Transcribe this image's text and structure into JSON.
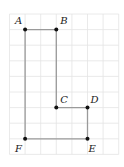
{
  "diagram": {
    "grid": {
      "x0": 9.5,
      "y0": 14,
      "step": 15.6,
      "cols": 7,
      "rows": 9,
      "color": "#e4e4e4"
    },
    "points": [
      {
        "id": "A",
        "label": "A",
        "col": 1,
        "row": 1,
        "lx": -10,
        "ly": -6
      },
      {
        "id": "B",
        "label": "B",
        "col": 3,
        "row": 1,
        "lx": 4,
        "ly": -6
      },
      {
        "id": "C",
        "label": "C",
        "col": 3,
        "row": 6,
        "lx": 4,
        "ly": -5
      },
      {
        "id": "D",
        "label": "D",
        "col": 5,
        "row": 6,
        "lx": 3,
        "ly": -5
      },
      {
        "id": "E",
        "label": "E",
        "col": 5,
        "row": 8,
        "lx": 1,
        "ly": 13
      },
      {
        "id": "F",
        "label": "F",
        "col": 1,
        "row": 8,
        "lx": -10,
        "ly": 13
      }
    ],
    "polygon": [
      "A",
      "B",
      "C",
      "D",
      "E",
      "F"
    ],
    "line_color": "#9a9a9a",
    "point_color": "#111111"
  }
}
